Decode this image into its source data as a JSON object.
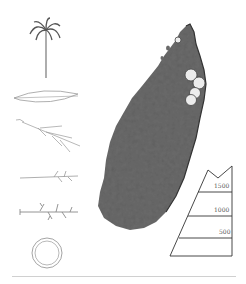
{
  "figure": {
    "left_column": [
      {
        "name": "palm-habit",
        "label": "palm tree habit"
      },
      {
        "name": "leaflet",
        "label": "leaflet"
      },
      {
        "name": "inflorescence",
        "label": "inflorescence branch"
      },
      {
        "name": "rachilla",
        "label": "rachilla"
      },
      {
        "name": "rachilla-flowers",
        "label": "rachilla with flowers"
      },
      {
        "name": "fruit-section",
        "label": "fruit cross-section"
      }
    ],
    "map": {
      "region": "Madagascar",
      "fill_color": "#6a6a6a",
      "marker_color": "#e8e8e8",
      "occurrence_markers": [
        {
          "x": 178,
          "y": 40
        },
        {
          "x": 191,
          "y": 75
        },
        {
          "x": 199,
          "y": 83
        },
        {
          "x": 195,
          "y": 93
        },
        {
          "x": 191,
          "y": 100
        }
      ]
    },
    "elevation_profile": {
      "labels": [
        "1500",
        "1000",
        "500"
      ],
      "unit": "m"
    }
  },
  "colors": {
    "line": "#333333",
    "light_line": "#9a9a9a",
    "divider": "#d0d0d0"
  }
}
